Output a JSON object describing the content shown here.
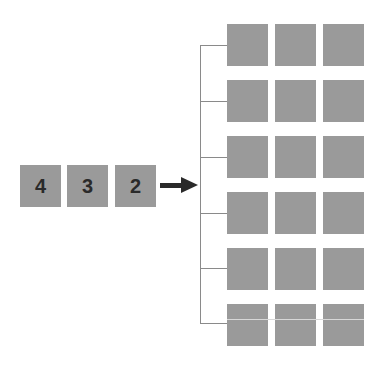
{
  "diagram": {
    "input_blocks": [
      {
        "label": "4",
        "x": 20,
        "y": 165
      },
      {
        "label": "3",
        "x": 67,
        "y": 165
      },
      {
        "label": "2",
        "x": 115,
        "y": 165
      }
    ],
    "arrow": {
      "direction": "right"
    },
    "grid": {
      "rows": 6,
      "cols": 3,
      "row_tops": [
        24,
        80,
        136,
        192,
        248,
        304
      ],
      "col_lefts": [
        227,
        275,
        323
      ]
    },
    "colors": {
      "block": "#9a9a9a",
      "label": "#2a2a2a",
      "connector": "#8a8a8a",
      "arrow": "#2a2a2a"
    }
  }
}
